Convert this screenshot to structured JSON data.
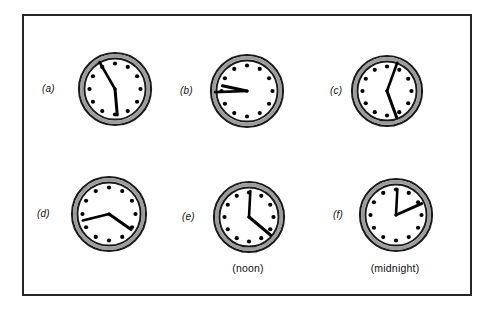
{
  "figure": {
    "background_color": "#ffffff",
    "frame_color": "#262626",
    "clock_rim_color": "#1a1a1a",
    "clock_band_color": "#9c9c9c",
    "clock_face_color": "#ffffff",
    "hand_color": "#000000",
    "marker_color": "#000000"
  },
  "clocks": [
    {
      "id": "clock-a",
      "label": "(a)",
      "caption": "",
      "hour_hand_deg": 175,
      "minute_hand_deg": 330,
      "hour_hand_len": 26,
      "minute_hand_len": 31,
      "cx": 114,
      "cy": 88,
      "radius": 36
    },
    {
      "id": "clock-b",
      "label": "(b)",
      "caption": "",
      "hour_hand_deg": 282,
      "minute_hand_deg": 268,
      "hour_hand_len": 25,
      "minute_hand_len": 32,
      "cx": 246,
      "cy": 90,
      "radius": 36
    },
    {
      "id": "clock-c",
      "label": "(c)",
      "caption": "",
      "hour_hand_deg": 160,
      "minute_hand_deg": 20,
      "hour_hand_len": 28,
      "minute_hand_len": 30,
      "cx": 386,
      "cy": 90,
      "radius": 35
    },
    {
      "id": "clock-d",
      "label": "(d)",
      "caption": "",
      "hour_hand_deg": 125,
      "minute_hand_deg": 256,
      "hour_hand_len": 27,
      "minute_hand_len": 27,
      "cx": 108,
      "cy": 213,
      "radius": 37
    },
    {
      "id": "clock-e",
      "label": "(e)",
      "caption": "(noon)",
      "hour_hand_deg": 130,
      "minute_hand_deg": 3,
      "hour_hand_len": 28,
      "minute_hand_len": 26,
      "cx": 248,
      "cy": 216,
      "radius": 35
    },
    {
      "id": "clock-f",
      "label": "(f)",
      "caption": "(midnight)",
      "hour_hand_deg": 66,
      "minute_hand_deg": 3,
      "hour_hand_len": 28,
      "minute_hand_len": 26,
      "cx": 395,
      "cy": 214,
      "radius": 36
    }
  ]
}
